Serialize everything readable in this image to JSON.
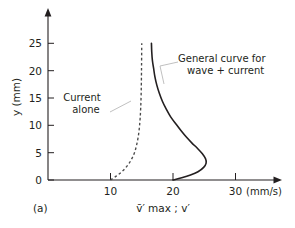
{
  "figure": {
    "panel_label": "(a)"
  },
  "chart_data": {
    "type": "line",
    "title": "",
    "xlabel": "v̄′ max ; v′",
    "ylabel": "y (mm)",
    "x_unit": "(mm/s)",
    "xlim": [
      0,
      33
    ],
    "ylim": [
      0,
      27
    ],
    "grid": false,
    "legend_position": "inline-annotations",
    "xticks": [
      10,
      20,
      30
    ],
    "xtick_labels": [
      "10",
      "20",
      "30"
    ],
    "yticks": [
      0,
      5,
      10,
      15,
      20,
      25
    ],
    "ytick_labels": [
      "0",
      "5",
      "10",
      "15",
      "20",
      "25"
    ],
    "series": [
      {
        "name": "General curve for wave + current",
        "style": "solid",
        "color": "#231f20",
        "x": [
          20.0,
          21.4,
          22.8,
          24.0,
          24.9,
          25.3,
          25.2,
          24.7,
          23.9,
          23.0,
          22.1,
          21.3,
          20.5,
          19.6,
          18.9,
          18.3,
          17.8,
          17.4,
          17.1,
          16.9,
          16.7,
          16.6,
          16.55
        ],
        "y": [
          0.0,
          0.4,
          0.9,
          1.5,
          2.3,
          3.1,
          3.9,
          4.8,
          5.8,
          6.8,
          7.9,
          9.0,
          10.2,
          11.6,
          13.0,
          14.4,
          15.9,
          17.4,
          18.9,
          20.4,
          21.9,
          23.4,
          25.0
        ]
      },
      {
        "name": "Current alone",
        "style": "dashed",
        "color": "#4a4a4a",
        "x": [
          10.0,
          10.9,
          11.7,
          12.4,
          13.0,
          13.5,
          13.9,
          14.2,
          14.45,
          14.62,
          14.75,
          14.84,
          14.9,
          14.94,
          14.97,
          15.0
        ],
        "y": [
          0.0,
          0.7,
          1.4,
          2.2,
          3.1,
          4.1,
          5.2,
          6.5,
          8.0,
          9.6,
          11.4,
          13.4,
          15.6,
          18.0,
          21.0,
          25.0
        ]
      }
    ],
    "annotations": [
      {
        "name": "wave-plus-current",
        "line1": "General curve for",
        "line2": "wave + current"
      },
      {
        "name": "current-alone",
        "line1": "Current",
        "line2": "alone"
      }
    ]
  }
}
